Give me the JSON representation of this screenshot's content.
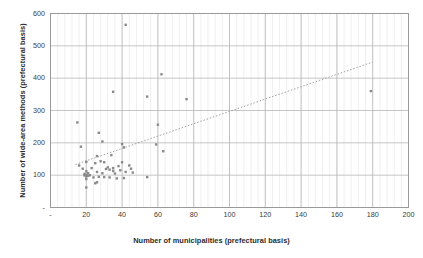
{
  "chart_data": {
    "type": "scatter",
    "title": "",
    "xlabel": "Number of municipalities (prefectural basis)",
    "ylabel": "Number of wide-area methods (prefectural basis)",
    "xlim": [
      0,
      200
    ],
    "ylim": [
      0,
      600
    ],
    "xticks": [
      0,
      20,
      40,
      60,
      80,
      100,
      120,
      140,
      160,
      180,
      200
    ],
    "xtick_labels": [
      "-",
      "20",
      "40",
      "60",
      "80",
      "100",
      "120",
      "140",
      "160",
      "180",
      "200"
    ],
    "yticks": [
      0,
      100,
      200,
      300,
      400,
      500,
      600
    ],
    "ytick_labels": [
      "-",
      "100",
      "200",
      "300",
      "400",
      "500",
      "600"
    ],
    "grid": true,
    "grid_minor_vertical": true,
    "legend": null,
    "marker_color": "#8a8a8a",
    "grid_color": "#b8b8b8",
    "minor_grid_color": "#e4e4e4",
    "axis_color": "#999999",
    "trendline": {
      "style": "dotted",
      "color": "#a0a0a0",
      "x0": 14,
      "y0": 133,
      "x1": 180,
      "y1": 450
    },
    "points": [
      {
        "x": 15,
        "y": 263
      },
      {
        "x": 16,
        "y": 130
      },
      {
        "x": 17,
        "y": 188
      },
      {
        "x": 18,
        "y": 120
      },
      {
        "x": 19,
        "y": 104
      },
      {
        "x": 19,
        "y": 99
      },
      {
        "x": 20,
        "y": 141
      },
      {
        "x": 20,
        "y": 112
      },
      {
        "x": 20,
        "y": 101
      },
      {
        "x": 20,
        "y": 96
      },
      {
        "x": 20,
        "y": 88
      },
      {
        "x": 20,
        "y": 62
      },
      {
        "x": 21,
        "y": 106
      },
      {
        "x": 21,
        "y": 98
      },
      {
        "x": 22,
        "y": 100
      },
      {
        "x": 23,
        "y": 122
      },
      {
        "x": 24,
        "y": 93
      },
      {
        "x": 25,
        "y": 137
      },
      {
        "x": 25,
        "y": 75
      },
      {
        "x": 26,
        "y": 159
      },
      {
        "x": 26,
        "y": 110
      },
      {
        "x": 26,
        "y": 78
      },
      {
        "x": 27,
        "y": 231
      },
      {
        "x": 27,
        "y": 95
      },
      {
        "x": 28,
        "y": 143
      },
      {
        "x": 29,
        "y": 204
      },
      {
        "x": 29,
        "y": 106
      },
      {
        "x": 30,
        "y": 140
      },
      {
        "x": 30,
        "y": 94
      },
      {
        "x": 31,
        "y": 119
      },
      {
        "x": 32,
        "y": 124
      },
      {
        "x": 33,
        "y": 117
      },
      {
        "x": 33,
        "y": 93
      },
      {
        "x": 34,
        "y": 162
      },
      {
        "x": 35,
        "y": 358
      },
      {
        "x": 35,
        "y": 122
      },
      {
        "x": 35,
        "y": 113
      },
      {
        "x": 36,
        "y": 105
      },
      {
        "x": 37,
        "y": 90
      },
      {
        "x": 38,
        "y": 128
      },
      {
        "x": 39,
        "y": 115
      },
      {
        "x": 40,
        "y": 196
      },
      {
        "x": 40,
        "y": 140
      },
      {
        "x": 41,
        "y": 186
      },
      {
        "x": 41,
        "y": 91
      },
      {
        "x": 42,
        "y": 565
      },
      {
        "x": 42,
        "y": 110
      },
      {
        "x": 44,
        "y": 130
      },
      {
        "x": 45,
        "y": 120
      },
      {
        "x": 46,
        "y": 108
      },
      {
        "x": 54,
        "y": 343
      },
      {
        "x": 54,
        "y": 94
      },
      {
        "x": 59,
        "y": 195
      },
      {
        "x": 60,
        "y": 256
      },
      {
        "x": 62,
        "y": 412
      },
      {
        "x": 63,
        "y": 174
      },
      {
        "x": 76,
        "y": 335
      },
      {
        "x": 179,
        "y": 360
      }
    ]
  },
  "axes": {
    "x_title": "Number of municipalities (prefectural basis)",
    "y_title": "Number of wide-area methods (prefectural basis)"
  }
}
